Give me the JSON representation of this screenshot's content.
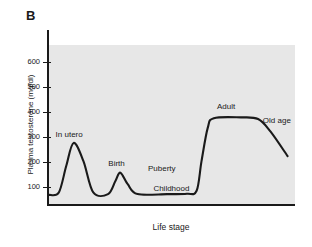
{
  "figure": {
    "panel_label": "B",
    "background_color": "#ffffff",
    "plot_background_color": "#e7e7e7",
    "line_color": "#1a1a1a"
  },
  "chart_data": {
    "type": "line",
    "title": "",
    "panel": "B",
    "xlabel": "Life stage",
    "ylabel": "Plasma testosterone (mg/dl)",
    "ylim": [
      0,
      650
    ],
    "yticks": [
      100,
      200,
      300,
      400,
      500,
      600
    ],
    "ytick_labels": [
      "100",
      "200",
      "300",
      "400",
      "500",
      "600"
    ],
    "xticks": [],
    "xtick_labels": [],
    "grid": false,
    "legend": false,
    "x_axis_type": "categorical-qualitative",
    "annotations": [
      {
        "text": "In utero",
        "x": 0.1,
        "y": 420
      },
      {
        "text": "Birth",
        "x": 0.29,
        "y": 245
      },
      {
        "text": "Childhood",
        "x": 0.53,
        "y": 90
      },
      {
        "text": "Puberty",
        "x": 0.5,
        "y": 215
      },
      {
        "text": "Adult",
        "x": 0.74,
        "y": 585
      },
      {
        "text": "Old age",
        "x": 0.91,
        "y": 505
      }
    ],
    "series": [
      {
        "name": "Plasma testosterone across life stages",
        "points": [
          {
            "stage": "conception",
            "x": 0.0,
            "y": 55
          },
          {
            "stage": "early gestation",
            "x": 0.04,
            "y": 70
          },
          {
            "stage": "in utero rise",
            "x": 0.07,
            "y": 230
          },
          {
            "stage": "in utero peak",
            "x": 0.1,
            "y": 370
          },
          {
            "stage": "in utero fall",
            "x": 0.14,
            "y": 260
          },
          {
            "stage": "late gestation",
            "x": 0.18,
            "y": 70
          },
          {
            "stage": "pre-birth trough",
            "x": 0.24,
            "y": 60
          },
          {
            "stage": "birth rise",
            "x": 0.27,
            "y": 140
          },
          {
            "stage": "birth peak",
            "x": 0.29,
            "y": 190
          },
          {
            "stage": "post-birth fall",
            "x": 0.32,
            "y": 120
          },
          {
            "stage": "infancy",
            "x": 0.36,
            "y": 60
          },
          {
            "stage": "childhood",
            "x": 0.48,
            "y": 60
          },
          {
            "stage": "late childhood",
            "x": 0.56,
            "y": 62
          },
          {
            "stage": "puberty onset",
            "x": 0.6,
            "y": 80
          },
          {
            "stage": "puberty rise",
            "x": 0.62,
            "y": 260
          },
          {
            "stage": "puberty late",
            "x": 0.645,
            "y": 460
          },
          {
            "stage": "adult plateau start",
            "x": 0.67,
            "y": 520
          },
          {
            "stage": "adult plateau mid",
            "x": 0.78,
            "y": 525
          },
          {
            "stage": "adult plateau end",
            "x": 0.85,
            "y": 515
          },
          {
            "stage": "old age decline",
            "x": 0.9,
            "y": 440
          },
          {
            "stage": "old age",
            "x": 0.97,
            "y": 290
          }
        ]
      }
    ]
  }
}
